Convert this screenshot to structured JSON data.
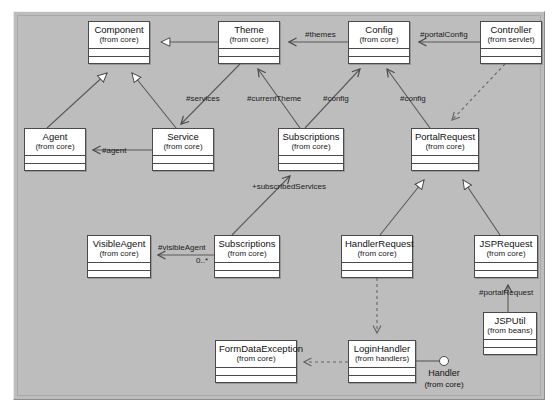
{
  "diagram": {
    "background_color": "#bdbdbd",
    "class_fill_color": "#ffffff",
    "line_color": "#4a4a4a"
  },
  "classes": [
    {
      "id": "component",
      "name": "Component",
      "package": "(from core)",
      "x": 88,
      "y": 21,
      "w": 62,
      "h": 43
    },
    {
      "id": "theme",
      "name": "Theme",
      "package": "(from core)",
      "x": 218,
      "y": 21,
      "w": 62,
      "h": 43
    },
    {
      "id": "config",
      "name": "Config",
      "package": "(from core)",
      "x": 348,
      "y": 21,
      "w": 62,
      "h": 43
    },
    {
      "id": "controller",
      "name": "Controller",
      "package": "(from servlet)",
      "x": 480,
      "y": 21,
      "w": 62,
      "h": 43
    },
    {
      "id": "agent",
      "name": "Agent",
      "package": "(from core)",
      "x": 24,
      "y": 128,
      "w": 62,
      "h": 43
    },
    {
      "id": "service",
      "name": "Service",
      "package": "(from core)",
      "x": 152,
      "y": 128,
      "w": 62,
      "h": 43
    },
    {
      "id": "subscriptions-1",
      "name": "Subscriptions",
      "package": "(from core)",
      "x": 278,
      "y": 128,
      "w": 66,
      "h": 43
    },
    {
      "id": "portalrequest",
      "name": "PortalRequest",
      "package": "(from core)",
      "x": 411,
      "y": 128,
      "w": 68,
      "h": 43
    },
    {
      "id": "visibleagent",
      "name": "VisibleAgent",
      "package": "(from core)",
      "x": 87,
      "y": 235,
      "w": 64,
      "h": 43
    },
    {
      "id": "subscriptions-2",
      "name": "Subscriptions",
      "package": "(from core)",
      "x": 214,
      "y": 235,
      "w": 66,
      "h": 43
    },
    {
      "id": "handlerrequest",
      "name": "HandlerRequest",
      "package": "(from core)",
      "x": 341,
      "y": 235,
      "w": 72,
      "h": 43
    },
    {
      "id": "jsprequest",
      "name": "JSPRequest",
      "package": "(from core)",
      "x": 474,
      "y": 235,
      "w": 64,
      "h": 43
    },
    {
      "id": "jsputil",
      "name": "JSPUtil",
      "package": "(from beans)",
      "x": 483,
      "y": 312,
      "w": 54,
      "h": 43
    },
    {
      "id": "formdataexception",
      "name": "FormDataException",
      "package": "(from core)",
      "x": 215,
      "y": 340,
      "w": 82,
      "h": 43
    },
    {
      "id": "loginhandler",
      "name": "LoginHandler",
      "package": "(from handlers)",
      "x": 348,
      "y": 340,
      "w": 68,
      "h": 43
    }
  ],
  "interfaces": [
    {
      "id": "handler",
      "name": "Handler",
      "package": "(from core)",
      "cx": 444,
      "cy": 361,
      "label_x": 416,
      "label_y": 368
    }
  ],
  "edge_labels": [
    {
      "id": "themes",
      "text": "#themes",
      "x": 305,
      "y": 30
    },
    {
      "id": "portalconfig",
      "text": "#portalConfig",
      "x": 420,
      "y": 30
    },
    {
      "id": "services",
      "text": "#services",
      "x": 186,
      "y": 94
    },
    {
      "id": "currentTheme",
      "text": "#currentTheme",
      "x": 247,
      "y": 94
    },
    {
      "id": "config-left",
      "text": "#config",
      "x": 323,
      "y": 94
    },
    {
      "id": "config-right",
      "text": "#config",
      "x": 400,
      "y": 94
    },
    {
      "id": "agent",
      "text": "#agent",
      "x": 102,
      "y": 146
    },
    {
      "id": "subscribedServices",
      "text": "+subscribedServices",
      "x": 252,
      "y": 182
    },
    {
      "id": "visibleAgent",
      "text": "#visibleAgent",
      "x": 158,
      "y": 243
    },
    {
      "id": "multiplicity",
      "text": "0..*",
      "x": 196,
      "y": 256
    },
    {
      "id": "portalRequest",
      "text": "#portalRequest",
      "x": 479,
      "y": 288
    }
  ]
}
